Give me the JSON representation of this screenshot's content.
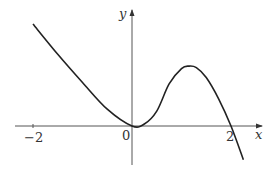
{
  "chart_data": {
    "type": "line",
    "title": "",
    "xlabel": "x",
    "ylabel": "y",
    "x_ticks": [
      -2,
      0,
      2
    ],
    "tick_labels": {
      "neg2": "−2",
      "zero": "0",
      "two": "2"
    },
    "grid": false,
    "legend": "none",
    "xlim": [
      -2.35,
      2.6
    ],
    "ylim": [
      -0.8,
      2.35
    ],
    "series": [
      {
        "name": "f(x)",
        "x": [
          -2.0,
          -1.5,
          -1.0,
          -0.5,
          0.0,
          0.25,
          0.5,
          0.75,
          1.0,
          1.15,
          1.3,
          1.5,
          1.75,
          2.0,
          2.25
        ],
        "y": [
          2.06,
          1.45,
          0.88,
          0.34,
          0.0,
          0.04,
          0.3,
          0.85,
          1.16,
          1.21,
          1.18,
          0.98,
          0.55,
          0.0,
          -0.68
        ]
      }
    ],
    "annotations": {
      "origin": "0",
      "root": "2",
      "curve_min": [
        0,
        0
      ],
      "local_max": [
        1.15,
        1.21
      ]
    }
  },
  "labels": {
    "y_axis": "y",
    "x_axis": "x",
    "neg2": "−2",
    "origin": "0",
    "two": "2"
  },
  "colors": {
    "curve": "#222222",
    "axes": "#555555"
  }
}
